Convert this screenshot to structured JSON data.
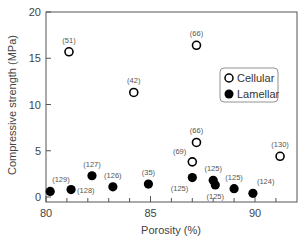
{
  "chart_data": {
    "type": "scatter",
    "title": "",
    "xlabel": "Porosity (%)",
    "ylabel": "Compressive strength (MPa)",
    "xlim": [
      80,
      92
    ],
    "ylim": [
      0,
      20
    ],
    "xticks": [
      80,
      85,
      90
    ],
    "xminor_ticks": [
      81,
      82,
      83,
      84,
      86,
      87,
      88,
      89,
      91
    ],
    "yticks": [
      0,
      5,
      10,
      15,
      20
    ],
    "grid": false,
    "legend_position": "right-center inside",
    "series": [
      {
        "name": "Cellular",
        "marker": "open-circle",
        "points": [
          {
            "x": 81.1,
            "y": 15.7,
            "label": "(51)"
          },
          {
            "x": 84.2,
            "y": 11.3,
            "label": "(42)"
          },
          {
            "x": 87.2,
            "y": 16.4,
            "label": "(66)"
          },
          {
            "x": 87.2,
            "y": 5.9,
            "label": "(66)"
          },
          {
            "x": 87.0,
            "y": 3.8,
            "label": "(69)"
          },
          {
            "x": 91.2,
            "y": 4.4,
            "label": "(130)"
          }
        ]
      },
      {
        "name": "Lamellar",
        "marker": "filled-circle",
        "points": [
          {
            "x": 80.2,
            "y": 0.6,
            "label": "(129)"
          },
          {
            "x": 81.2,
            "y": 0.8,
            "label": "(128)"
          },
          {
            "x": 82.2,
            "y": 2.3,
            "label": "(127)"
          },
          {
            "x": 83.2,
            "y": 1.1,
            "label": "(126)"
          },
          {
            "x": 84.9,
            "y": 1.4,
            "label": "(35)"
          },
          {
            "x": 87.0,
            "y": 2.1,
            "label": "(125)"
          },
          {
            "x": 88.0,
            "y": 1.8,
            "label": "(125)"
          },
          {
            "x": 88.1,
            "y": 1.3,
            "label": "(125)"
          },
          {
            "x": 89.0,
            "y": 0.9,
            "label": "(125)"
          },
          {
            "x": 89.9,
            "y": 0.4,
            "label": "(124)"
          }
        ]
      }
    ]
  },
  "legend": {
    "items": [
      {
        "label": "Cellular",
        "marker": "open-circle"
      },
      {
        "label": "Lamellar",
        "marker": "filled-circle"
      }
    ]
  },
  "colors": {
    "axis": "#555555",
    "marker": "#000000",
    "text": "#444444"
  }
}
